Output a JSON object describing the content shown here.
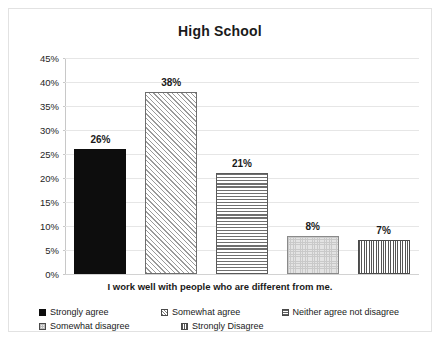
{
  "chart_data": {
    "type": "bar",
    "title": "High School",
    "xlabel": "I work well with people who are different from me.",
    "ylabel": "",
    "categories": [
      "Strongly agree",
      "Somewhat agree",
      "Neither agree not disagree",
      "Somewhat disagree",
      "Strongly Disagree"
    ],
    "values": [
      26,
      38,
      21,
      8,
      7
    ],
    "data_labels": [
      "26%",
      "38%",
      "21%",
      "8%",
      "7%"
    ],
    "ylim": [
      0,
      45
    ],
    "ytick_labels": [
      "45%",
      "40%",
      "35%",
      "30%",
      "25%",
      "20%",
      "15%",
      "10%",
      "5%",
      "0%"
    ],
    "ytick_values": [
      45,
      40,
      35,
      30,
      25,
      20,
      15,
      10,
      5,
      0
    ],
    "grid": true,
    "legend_position": "bottom",
    "series_patterns": [
      "solid-black",
      "diagonal-hatch",
      "horizontal-lines",
      "light-stipple",
      "fine-crosshatch"
    ],
    "colors": {
      "gridline": "#e6e6e6",
      "axis": "#c8c8c8",
      "text": "#1a1a1a",
      "bar_solid": "#0d0d0d",
      "plot_background": "#ffffff",
      "frame_border": "#e2e2e2"
    }
  },
  "legend": {
    "row1": [
      {
        "label": "Strongly agree",
        "pattern": "p-solid"
      },
      {
        "label": "Somewhat agree",
        "pattern": "p-diag"
      },
      {
        "label": "Neither agree not disagree",
        "pattern": "p-horz"
      }
    ],
    "row2": [
      {
        "label": "Somewhat disagree",
        "pattern": "p-dots"
      },
      {
        "label": "Strongly Disagree",
        "pattern": "p-grid"
      }
    ]
  }
}
